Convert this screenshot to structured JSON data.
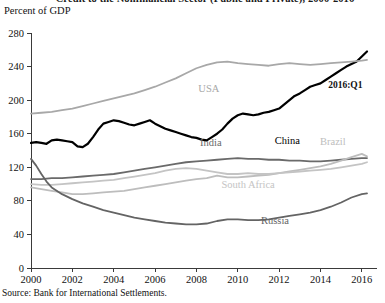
{
  "title": "Credit to the Nonfinancial Sector (Public and Private), 2000-2016",
  "axis_unit_label": "Percent of GDP",
  "source": "Source: Bank for International Settlements.",
  "annotation": "2016:Q1",
  "colors": {
    "china": "#000000",
    "usa": "#a8a8a8",
    "india": "#6a6a6a",
    "brazil": "#bdbdbd",
    "south_africa": "#c4c4c4",
    "russia": "#646464",
    "axis": "#3a3a3a",
    "text": "#111111"
  },
  "chart_data": {
    "type": "line",
    "title": "Credit to the Nonfinancial Sector (Public and Private), 2000-2016",
    "xlabel": "",
    "ylabel": "Percent of GDP",
    "xlim": [
      2000,
      2016.25
    ],
    "ylim": [
      0,
      280
    ],
    "yticks": [
      0,
      40,
      80,
      120,
      160,
      200,
      240,
      280
    ],
    "xticks": [
      2000,
      2002,
      2004,
      2006,
      2008,
      2010,
      2012,
      2014,
      2016
    ],
    "grid": false,
    "legend": "inline-labels",
    "annotations": [
      {
        "text": "2016:Q1",
        "x": 2015.2,
        "y": 215
      }
    ],
    "series": [
      {
        "name": "China",
        "color": "#000000",
        "width": 2.2,
        "label_pos": {
          "x": 2012.4,
          "y": 148
        },
        "x": [
          2000,
          2000.25,
          2000.5,
          2000.75,
          2001,
          2001.25,
          2001.5,
          2001.75,
          2002,
          2002.25,
          2002.5,
          2002.75,
          2003,
          2003.25,
          2003.5,
          2003.75,
          2004,
          2004.25,
          2004.5,
          2004.75,
          2005,
          2005.25,
          2005.5,
          2005.75,
          2006,
          2006.25,
          2006.5,
          2006.75,
          2007,
          2007.25,
          2007.5,
          2007.75,
          2008,
          2008.25,
          2008.5,
          2008.75,
          2009,
          2009.25,
          2009.5,
          2009.75,
          2010,
          2010.25,
          2010.5,
          2010.75,
          2011,
          2011.25,
          2011.5,
          2011.75,
          2012,
          2012.25,
          2012.5,
          2012.75,
          2013,
          2013.25,
          2013.5,
          2013.75,
          2014,
          2014.25,
          2014.5,
          2014.75,
          2015,
          2015.25,
          2015.5,
          2015.75,
          2016,
          2016.25
        ],
        "y": [
          149,
          150,
          149,
          148,
          152,
          153,
          152,
          151,
          150,
          145,
          144,
          148,
          156,
          165,
          172,
          174,
          176,
          175,
          173,
          171,
          170,
          172,
          174,
          176,
          172,
          169,
          166,
          164,
          162,
          160,
          158,
          156,
          155,
          153,
          152,
          156,
          160,
          165,
          172,
          178,
          182,
          184,
          183,
          182,
          183,
          185,
          186,
          188,
          190,
          195,
          200,
          205,
          208,
          212,
          216,
          218,
          220,
          224,
          228,
          232,
          236,
          240,
          243,
          246,
          252,
          258
        ]
      },
      {
        "name": "USA",
        "color": "#a8a8a8",
        "width": 1.8,
        "label_pos": {
          "x": 2008.6,
          "y": 210
        },
        "x": [
          2000,
          2000.5,
          2001,
          2001.5,
          2002,
          2002.5,
          2003,
          2003.5,
          2004,
          2004.5,
          2005,
          2005.5,
          2006,
          2006.5,
          2007,
          2007.5,
          2008,
          2008.5,
          2009,
          2009.5,
          2010,
          2010.5,
          2011,
          2011.5,
          2012,
          2012.5,
          2013,
          2013.5,
          2014,
          2014.5,
          2015,
          2015.5,
          2016,
          2016.25
        ],
        "y": [
          184,
          185,
          186,
          188,
          190,
          193,
          196,
          199,
          202,
          205,
          208,
          212,
          216,
          221,
          226,
          232,
          238,
          242,
          245,
          246,
          244,
          243,
          242,
          241,
          243,
          244,
          243,
          242,
          243,
          244,
          245,
          246,
          247,
          248
        ]
      },
      {
        "name": "India",
        "color": "#6a6a6a",
        "width": 1.8,
        "label_pos": {
          "x": 2008.7,
          "y": 145
        },
        "x": [
          2000,
          2000.5,
          2001,
          2001.5,
          2002,
          2002.5,
          2003,
          2003.5,
          2004,
          2004.5,
          2005,
          2005.5,
          2006,
          2006.5,
          2007,
          2007.5,
          2008,
          2008.5,
          2009,
          2009.5,
          2010,
          2010.5,
          2011,
          2011.5,
          2012,
          2012.5,
          2013,
          2013.5,
          2014,
          2014.5,
          2015,
          2015.5,
          2016,
          2016.25
        ],
        "y": [
          106,
          106,
          107,
          107,
          108,
          109,
          110,
          111,
          112,
          114,
          116,
          118,
          120,
          122,
          124,
          126,
          127,
          128,
          129,
          130,
          131,
          130,
          130,
          129,
          129,
          128,
          128,
          127,
          127,
          128,
          129,
          130,
          131,
          131
        ]
      },
      {
        "name": "Brazil",
        "color": "#bdbdbd",
        "width": 1.8,
        "label_pos": {
          "x": 2014.6,
          "y": 147
        },
        "x": [
          2000,
          2000.5,
          2001,
          2001.5,
          2002,
          2002.5,
          2003,
          2003.5,
          2004,
          2004.5,
          2005,
          2005.5,
          2006,
          2006.5,
          2007,
          2007.5,
          2008,
          2008.5,
          2009,
          2009.5,
          2010,
          2010.5,
          2011,
          2011.5,
          2012,
          2012.5,
          2013,
          2013.5,
          2014,
          2014.5,
          2015,
          2015.5,
          2016,
          2016.25
        ],
        "y": [
          96,
          94,
          92,
          90,
          88,
          88,
          89,
          90,
          91,
          92,
          94,
          96,
          98,
          100,
          102,
          104,
          106,
          107,
          110,
          108,
          108,
          109,
          110,
          111,
          113,
          115,
          117,
          119,
          121,
          124,
          128,
          132,
          136,
          133
        ]
      },
      {
        "name": "South Africa",
        "color": "#c4c4c4",
        "width": 1.8,
        "label_pos": {
          "x": 2010.5,
          "y": 95
        },
        "x": [
          2000,
          2000.5,
          2001,
          2001.5,
          2002,
          2002.5,
          2003,
          2003.5,
          2004,
          2004.5,
          2005,
          2005.5,
          2006,
          2006.5,
          2007,
          2007.5,
          2008,
          2008.5,
          2009,
          2009.5,
          2010,
          2010.5,
          2011,
          2011.5,
          2012,
          2012.5,
          2013,
          2013.5,
          2014,
          2014.5,
          2015,
          2015.5,
          2016,
          2016.25
        ],
        "y": [
          100,
          99,
          99,
          100,
          101,
          102,
          103,
          104,
          105,
          107,
          109,
          111,
          113,
          116,
          118,
          119,
          118,
          116,
          114,
          112,
          112,
          113,
          112,
          112,
          113,
          114,
          115,
          116,
          117,
          118,
          120,
          122,
          124,
          126
        ]
      },
      {
        "name": "Russia",
        "color": "#646464",
        "width": 1.8,
        "label_pos": {
          "x": 2011.8,
          "y": 52
        },
        "x": [
          2000,
          2000.25,
          2000.5,
          2000.75,
          2001,
          2001.5,
          2002,
          2002.5,
          2003,
          2003.5,
          2004,
          2004.5,
          2005,
          2005.5,
          2006,
          2006.5,
          2007,
          2007.5,
          2008,
          2008.5,
          2009,
          2009.5,
          2010,
          2010.5,
          2011,
          2011.5,
          2012,
          2012.5,
          2013,
          2013.5,
          2014,
          2014.5,
          2015,
          2015.5,
          2016,
          2016.25
        ],
        "y": [
          130,
          122,
          112,
          103,
          96,
          88,
          82,
          77,
          73,
          69,
          66,
          63,
          60,
          58,
          56,
          54,
          53,
          52,
          52,
          53,
          56,
          58,
          58,
          57,
          57,
          58,
          60,
          62,
          64,
          66,
          69,
          73,
          78,
          84,
          88,
          89
        ]
      }
    ]
  }
}
